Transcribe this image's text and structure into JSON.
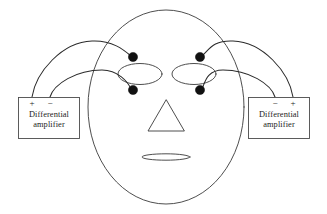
{
  "figure": {
    "background_color": "#ffffff",
    "line_color": "#3a3a3a",
    "electrode_color": "#111111"
  },
  "face": {
    "outline_name": "face-outline",
    "left_eye_name": "left-eye",
    "right_eye_name": "right-eye",
    "nose_name": "nose-triangle",
    "mouth_name": "mouth"
  },
  "electrodes": [
    {
      "id": "left-upper",
      "label": "",
      "cx": 133,
      "cy": 57,
      "r": 4.6
    },
    {
      "id": "left-lower",
      "label": "",
      "cx": 133,
      "cy": 90,
      "r": 4.6
    },
    {
      "id": "right-upper",
      "label": "",
      "cx": 200,
      "cy": 57,
      "r": 4.6
    },
    {
      "id": "right-lower",
      "label": "",
      "cx": 200,
      "cy": 90,
      "r": 4.6
    }
  ],
  "amplifiers": {
    "left": {
      "line1": "Differential",
      "line2": "amplifier",
      "terminals": {
        "first": "+",
        "second": "−"
      }
    },
    "right": {
      "line1": "Differential",
      "line2": "amplifier",
      "terminals": {
        "first": "−",
        "second": "+"
      }
    }
  }
}
